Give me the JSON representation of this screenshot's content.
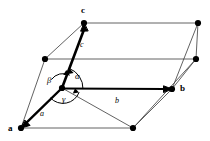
{
  "figure": {
    "type": "crystallographic-unit-cell",
    "shape": "parallelepiped",
    "background_color": "#ffffff",
    "stroke_color": "#000000",
    "thin_edge_color": "#3a3a3a"
  },
  "axis_labels": [
    {
      "id": "c",
      "text": "c",
      "x": 81,
      "y": 6
    },
    {
      "id": "b",
      "text": "b",
      "x": 180,
      "y": 84
    },
    {
      "id": "a",
      "text": "a",
      "x": 8,
      "y": 124
    }
  ],
  "vector_labels": [
    {
      "id": "c-vec",
      "text": "c",
      "x": 80,
      "y": 41
    },
    {
      "id": "b-vec",
      "text": "b",
      "x": 115,
      "y": 97
    },
    {
      "id": "a-vec",
      "text": "a",
      "x": 40,
      "y": 110
    }
  ],
  "angle_labels": [
    {
      "id": "alpha",
      "text": "α",
      "x": 75,
      "y": 72
    },
    {
      "id": "beta",
      "text": "β",
      "x": 47,
      "y": 76
    },
    {
      "id": "gamma",
      "text": "γ",
      "x": 62,
      "y": 95
    }
  ],
  "vertices": [
    {
      "id": "origin",
      "x": 62,
      "y": 88
    },
    {
      "id": "a-corner",
      "x": 21,
      "y": 128
    },
    {
      "id": "b-corner",
      "x": 172,
      "y": 89
    },
    {
      "id": "c-corner",
      "x": 84,
      "y": 23
    },
    {
      "id": "ab-corner",
      "x": 133,
      "y": 128
    },
    {
      "id": "ac-corner",
      "x": 45,
      "y": 59
    },
    {
      "id": "bc-corner",
      "x": 196,
      "y": 59
    },
    {
      "id": "abc-corner",
      "x": 198,
      "y": 23
    }
  ],
  "caption": ""
}
